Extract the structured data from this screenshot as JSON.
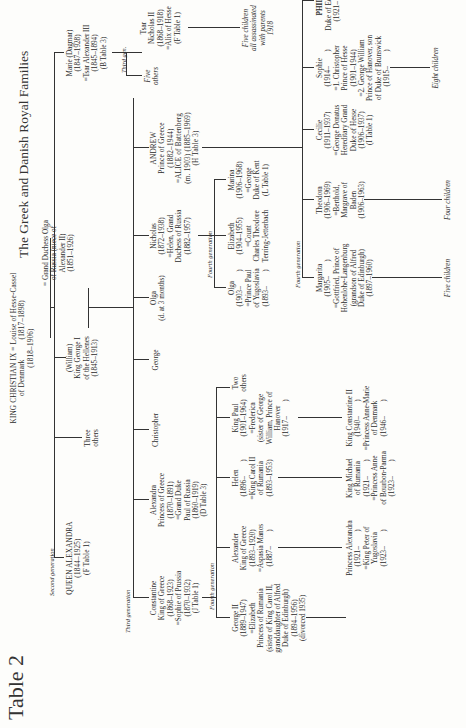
{
  "page": {
    "table_label": "Table 2",
    "title": "The Greek and Danish Royal Families"
  },
  "generations": {
    "second": "Second generation",
    "third_left": "Third generation",
    "third_gen_short": "Third gen.",
    "fourth_constantine": "Fourth generation",
    "fourth_nicholas": "Fourth generation",
    "fourth_andrew": "Fourth generation"
  },
  "root": {
    "christian": "KING CHRISTIAN IX = Louise of Hesse-Cassel\nof Denmark          (1817–1898)\n(1818–1906)"
  },
  "second_gen": {
    "alexandra": "QUEEN ALEXANDRA\n(1844–1925)\n(F Table 1)",
    "three_others": "Three\nothers",
    "george_i": "(William)\nKing George I\nof the Hellenes\n(1845–1913)",
    "olga_wife": "= Grand Duchess Olga\nof Russia (niece of\nAlexander II)\n(1851–1926)",
    "marie": "Marie (Dagmar)\n(1847–1928)\n=Tsar Alexander III\n(1845–1894)\n(B Table 3)"
  },
  "third_gen": {
    "constantine": "Constantine\nKing of Greece\n(1868–1923)\n=Sophie of Prussia\n(1870–1932)\n(J Table 1)",
    "alexandra": "Alexandra\nPrincess of Greece\n(1870–1891)\n=Grand Duke\nPaul of Russia\n(1860–1919)\n(D Table 3)",
    "christopher": "Christopher",
    "george": "George",
    "olga": "Olga\n(d. at 3 months)",
    "nicholas": "Nicholas\n(1872–1938)\n=Helen, Grand\nDuchess of Russia\n(1882–1957)",
    "andrew": "ANDREW\nPrince of Greece\n(1882–1944)\n=ALICE of Battenberg\n(m. 1903) (1885–1969)\n(H Table 3)",
    "tsar_nicholas": "Tsar\nNicholas II\n(1868–1918)\n=Alix of Hesse\n(F Table 1)",
    "five_others": "Five\nothers",
    "five_children": "Five children\nall assassinated\nwith parents\n1918"
  },
  "fourth_gen": {
    "george_ii": "George II\n(1889–1947)\n=Elizabeth\nPrincess of Rumania\n(sister of King Carol II,\ngranddaughter of Alfred\nDuke of Edinburgh)\n(1894–1956)\n(divorced 1935)",
    "alexander": "Alexander\nKing of Greece\n(1893–1920)\n=Aspasia Manos\n(1887–        )",
    "helen": "Helen\n(1896–        )\n=King Carol II\nof Rumania\n(1893–1953)",
    "paul": "King Paul\n(1901–1964)\n=Frederica\n(sister of George\nWilliam, Prince of\nHanover\n(1917–        )",
    "two_others": "Two\nothers",
    "olga": "Olga\n(1903–        )\n=Prince Paul\nof Yugoslavia\n(1893–        )",
    "elizabeth": "Elizabeth\n(1904–1955)\n=Count\nCharles Theodore\nTerring-Jetterbach",
    "marina": "Marina\n(1906–1968)\n=George\nDuke of Kent\n(L Table 1)",
    "margarita": "Margarita\n(1905–        )\n=Gottfried, Prince of\nHohenlohe-Langenburg\n(grandson of Alfred\nDuke of Edinburgh)\n(1897–1960)",
    "theodora": "Theodora\n(1906–1969)\n=Berthold,\nMargrave of\nBaden\n(1906–1963)",
    "cecilie": "Cecilie\n(1911–1937)\n=George Donatus\nHereditary Grand\nDuke of Hesse\n(1906–1937)\n(I Table 1)",
    "sophie": "Sophie\n(1914–        )\n=1. Christopher\nPrince of Hesse\n(1901–1944)\n=2. George William\nPrince of Hanover, son\nof Duke of Brunswick\n(1915–        )",
    "philip_name": "PHILIP",
    "philip_rest": "Duke of Edinburgh\n(1921–        )"
  },
  "fifth_gen": {
    "princess_alexandra": "Princess Alexandra\n(1921–        )\n=King Peter of\nYugoslavia\n(1923–        )",
    "michael": "King Michael\nof Rumania\n(1921–        )\n=Princess Anne\nof Bourbon-Parma\n(1923–        )",
    "constantine_ii": "King Constantine II\n(1940–        )\n=Princess Anne-Marie\nof Denmark\n(1946–        )",
    "five_children": "Five children",
    "four_children": "Four children",
    "eight_children": "Eight children"
  }
}
